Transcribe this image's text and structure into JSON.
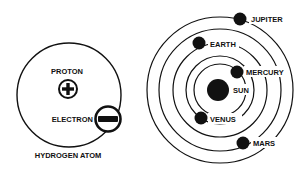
{
  "atom": {
    "title": "HYDROGEN ATOM",
    "proton_label": "PROTON",
    "electron_label": "ELECTRON",
    "proton_symbol": "plus-icon",
    "electron_symbol": "minus-icon"
  },
  "solar_system": {
    "sun_label": "SUN",
    "planets": [
      {
        "name": "MERCURY"
      },
      {
        "name": "VENUS"
      },
      {
        "name": "EARTH"
      },
      {
        "name": "MARS"
      },
      {
        "name": "JUPITER"
      }
    ]
  },
  "colors": {
    "ink": "#111111",
    "background": "#ffffff"
  }
}
